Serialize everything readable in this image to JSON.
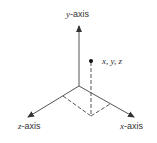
{
  "diagram": {
    "type": "3d-coordinate-axes",
    "axes": {
      "y": {
        "var": "y",
        "suffix": "-axis"
      },
      "z": {
        "var": "z",
        "suffix": "-axis"
      },
      "x": {
        "var": "x",
        "suffix": "-axis"
      }
    },
    "point_label": "x, y, z",
    "colors": {
      "line": "#333333",
      "background": "#ffffff"
    }
  }
}
